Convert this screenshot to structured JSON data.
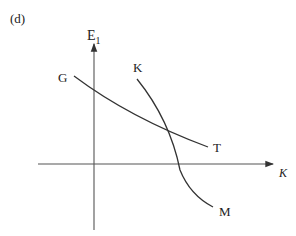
{
  "panel_label": "(d)",
  "axes": {
    "y_label_main": "E",
    "y_label_sub": "1",
    "x_label": "K"
  },
  "curves": [
    {
      "name": "GT",
      "start_label": "G",
      "end_label": "T"
    },
    {
      "name": "KM",
      "start_label": "K",
      "end_label": "M"
    }
  ],
  "colors": {
    "line": "#333333",
    "text": "#222222"
  }
}
